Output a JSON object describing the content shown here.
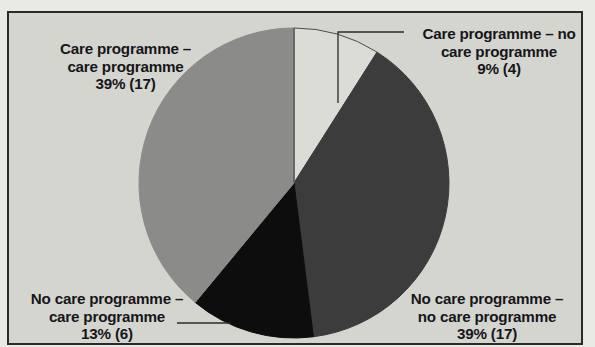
{
  "figure": {
    "background_color": "#d5d5cf",
    "frame_color": "#2a2a28",
    "text_color": "#16161a"
  },
  "chart_data": {
    "type": "pie",
    "title": "",
    "subtitle": "",
    "xlabel": "",
    "ylabel": "",
    "legend_position": "none",
    "grid": false,
    "start_angle_deg": 90,
    "direction": "clockwise",
    "total_count": 44,
    "categories": [
      "Care programme – no care programme",
      "No care programme – no care programme",
      "No care programme – care programme",
      "Care programme – care programme"
    ],
    "values": [
      9,
      39,
      13,
      39
    ],
    "counts": [
      4,
      17,
      6,
      17
    ],
    "colors": [
      "#dcdcd6",
      "#3c3c3c",
      "#0d0d0d",
      "#8b8b89"
    ],
    "slices": [
      {
        "name": "care-programme-no-care-programme",
        "label_line1": "Care programme – no",
        "label_line2": "care programme",
        "label_line3": "9% (4)",
        "percent": "9%",
        "count": "(4)",
        "value": 9,
        "color": "#dcdcd6",
        "leader": true
      },
      {
        "name": "no-care-programme-no-care-programme",
        "label_line1": "No care programme –",
        "label_line2": "no care programme",
        "label_line3": "39% (17)",
        "percent": "39%",
        "count": "(17)",
        "value": 39,
        "color": "#3c3c3c",
        "leader": false
      },
      {
        "name": "no-care-programme-care-programme",
        "label_line1": "No care programme –",
        "label_line2": "care programme",
        "label_line3": "13% (6)",
        "percent": "13%",
        "count": "(6)",
        "value": 13,
        "color": "#0d0d0d",
        "leader": true
      },
      {
        "name": "care-programme-care-programme",
        "label_line1": "Care programme –",
        "label_line2": "care programme",
        "label_line3": "39% (17)",
        "percent": "39%",
        "count": "(17)",
        "value": 39,
        "color": "#8b8b89",
        "leader": false
      }
    ]
  }
}
